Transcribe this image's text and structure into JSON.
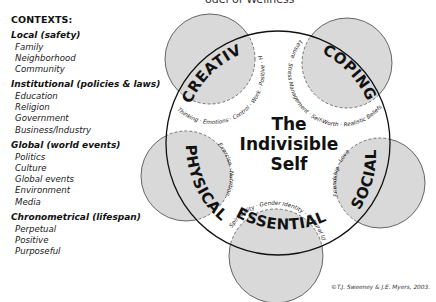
{
  "header": {
    "title_partial": "odel of Wellness"
  },
  "contexts": {
    "heading": "CONTEXTS:",
    "groups": [
      {
        "title": "Local (safety)",
        "items": [
          "Family",
          "Neighborhood",
          "Community"
        ]
      },
      {
        "title": "Institutional (policies & laws)",
        "items": [
          "Education",
          "Religion",
          "Government",
          "Business/Industry"
        ]
      },
      {
        "title": "Global (world events)",
        "items": [
          "Politics",
          "Culture",
          "Global events",
          "Environment",
          "Media"
        ]
      },
      {
        "title": "Chronometrical (lifespan)",
        "items": [
          "Perpetual",
          "Positive",
          "Purposeful"
        ]
      }
    ]
  },
  "diagram": {
    "center": {
      "line1": "The",
      "line2": "Indivisible",
      "line3": "Self"
    },
    "factors": {
      "creative": {
        "label": "CREATIVE",
        "subfactors": "Thinking · Emotions · Control · Work · Positive · Humor"
      },
      "coping": {
        "label": "COPING",
        "subfactors": "Leisure · Stress Management · Self-Worth · Realistic Beliefs"
      },
      "social": {
        "label": "SOCIAL",
        "subfactors": "Friendship · Love"
      },
      "essential": {
        "label": "ESSENTIAL",
        "subfactors": "Spirituality · Gender Identity · Cultural Identity · Self-Care"
      },
      "physical": {
        "label": "PHYSICAL",
        "subfactors": "Exercise · Nutrition"
      }
    },
    "colors": {
      "factor_fill": "#d9d9d9",
      "outline": "#111111",
      "dashed": "#666666",
      "background": "#ffffff"
    }
  },
  "footer": {
    "copyright": "©T.J. Sweeney & J.E. Myers, 2003."
  }
}
